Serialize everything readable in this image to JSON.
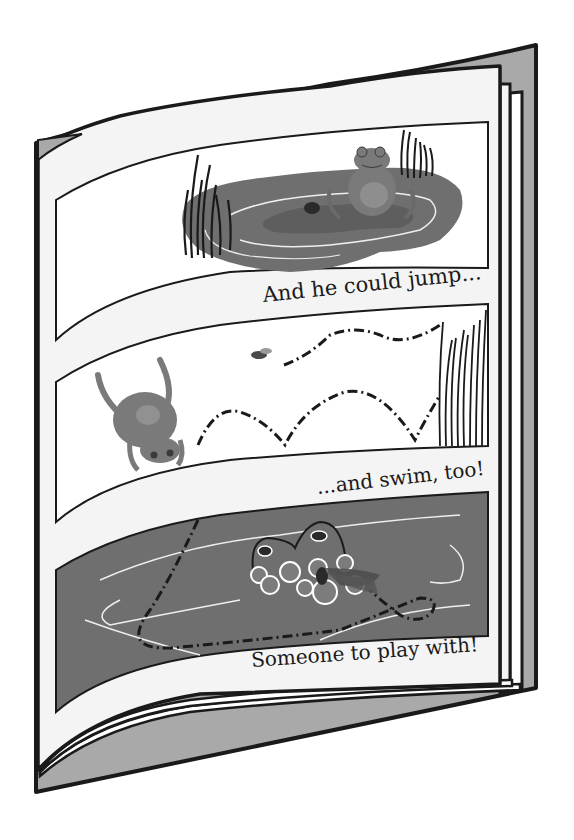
{
  "book": {
    "description": "Illustrated children's picture book, open to a page with three comic panels about a frog",
    "colors": {
      "cover": "#a9a9a9",
      "page": "#f4f4f4",
      "outline": "#1a1a1a",
      "pond": "#6f6f6f",
      "pond_dark": "#5e5e5e",
      "frog": "#7a7a7a",
      "ripple": "#eeeeee"
    }
  },
  "panels": [
    {
      "id": "panel-1",
      "scene": "frog sitting on lily pad in pond with reeds and a beetle",
      "caption": "And he could jump..."
    },
    {
      "id": "panel-2",
      "scene": "frog leaping with dashed jump trail toward tall reeds, fly flying",
      "caption": "...and swim, too!"
    },
    {
      "id": "panel-3",
      "scene": "frog swimming in pond with bubbles and fly, dashed swim path",
      "caption": "Someone to play with!"
    }
  ]
}
